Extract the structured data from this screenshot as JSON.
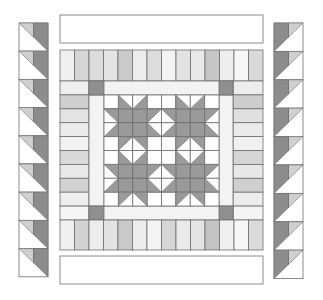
{
  "colors": {
    "background": "#ffffff",
    "outline": "#6e6e6e",
    "white": "#ffffff",
    "dark": "#8c8c8c",
    "medium": "#a8a8a8",
    "light": "#cfcfcf",
    "sashing": "#f3f3f3",
    "corner": "#8f8f8f",
    "star": "#9a9a9a",
    "banner_border": "#8a8a8a"
  },
  "layout": {
    "banner_top": {
      "x": 60,
      "y": 15,
      "w": 203,
      "h": 28
    },
    "banner_bottom": {
      "x": 60,
      "y": 256,
      "w": 203,
      "h": 28
    },
    "strip_row_top": {
      "x": 60,
      "y": 50,
      "w": 203,
      "h": 31
    },
    "strip_row_bottom": {
      "x": 60,
      "y": 220,
      "w": 203,
      "h": 30
    },
    "side_strips_left": {
      "x": 60,
      "y": 81,
      "w": 29,
      "h": 139
    },
    "side_strips_right": {
      "x": 233,
      "y": 81,
      "w": 30,
      "h": 139
    },
    "sashing_frame": {
      "x": 89,
      "y": 81,
      "w": 144,
      "h": 139,
      "band": 14
    },
    "inner_block": {
      "x": 104,
      "y": 95,
      "w": 115,
      "h": 111,
      "cols": 8,
      "rows": 8
    },
    "column_left": {
      "x": 19,
      "y": 23,
      "w": 29,
      "unit_h": 28.2,
      "units": 9
    },
    "column_right": {
      "x": 274,
      "y": 23,
      "w": 29,
      "unit_h": 28.4,
      "units": 9
    }
  },
  "strip_row_top_shades": [
    "#f0f0f0",
    "#d6d6d6",
    "#dcdcdc",
    "#e4e4e4",
    "#cbcbcb",
    "#ececec",
    "#dcdcdc",
    "#f3f3f3",
    "#e2e2e2",
    "#e9e9e9",
    "#c6c6c6",
    "#eeeeee",
    "#f6f6f6",
    "#d9d9d9"
  ],
  "strip_row_bottom_shades": [
    "#f0f0f0",
    "#d3d3d3",
    "#ececec",
    "#e2e2e2",
    "#c9c9c9",
    "#ededed",
    "#f4f4f4",
    "#d6d6d6",
    "#e9e9e9",
    "#e4e4e4",
    "#c4c4c4",
    "#f0f0f0",
    "#f7f7f7",
    "#dadada"
  ],
  "side_left_shades": [
    "#eeeeee",
    "#cfcfcf",
    "#e3e3e3",
    "#ebebeb",
    "#f3f3f3",
    "#d9d9d9",
    "#e8e8e8",
    "#d2d2d2",
    "#efefef",
    "#f5f5f5"
  ],
  "side_right_shades": [
    "#ededed",
    "#cdcdcd",
    "#e0e0e0",
    "#ebebeb",
    "#f0f0f0",
    "#d5d5d5",
    "#e7e7e7",
    "#cfcfcf",
    "#ececec",
    "#f4f4f4"
  ],
  "stars": [
    {
      "col": 0,
      "row": 0
    },
    {
      "col": 4,
      "row": 0
    },
    {
      "col": 0,
      "row": 4
    },
    {
      "col": 4,
      "row": 4
    }
  ],
  "border_unit": {
    "left": {
      "diagonal": "top-left-to-bottom-right",
      "small_triangle": "light",
      "half": "dark"
    },
    "right": {
      "diagonal": "top-right-to-bottom-left",
      "small_triangle": "light",
      "half": "dark"
    }
  }
}
